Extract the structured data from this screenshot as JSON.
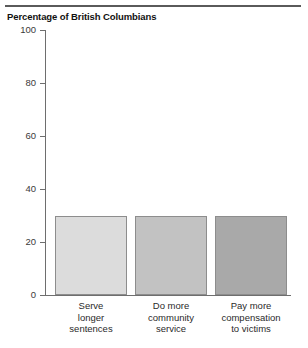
{
  "chart_data": {
    "type": "bar",
    "title": "Percentage of British Columbians",
    "xlabel": "",
    "ylabel": "",
    "ylim": [
      0,
      100
    ],
    "yticks": [
      0,
      20,
      40,
      60,
      80,
      100
    ],
    "ytick_labels": [
      "0",
      "20",
      "40",
      "60",
      "80",
      "100"
    ],
    "grid": false,
    "legend": false,
    "categories": [
      "Serve longer sentences",
      "Do more community service",
      "Pay more compensation to victims"
    ],
    "category_lines": [
      [
        "Serve",
        "longer",
        "sentences"
      ],
      [
        "Do more",
        "community",
        "service"
      ],
      [
        "Pay more",
        "compensation",
        "to victims"
      ]
    ],
    "values": [
      30,
      30,
      30
    ],
    "bar_colors": [
      "#dcdcdc",
      "#c2c2c2",
      "#a9a9a9"
    ],
    "bar_edge_color": "#8d8d8d",
    "axis_color": "#6e6e6e",
    "rule_color": "#5a5a5a",
    "text_color": "#1a1a1a"
  }
}
